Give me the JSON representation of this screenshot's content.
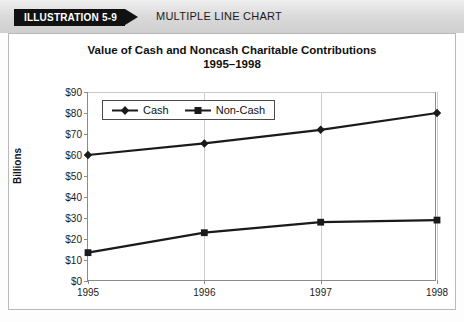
{
  "header": {
    "tag_label": "ILLUSTRATION 5-9",
    "caption": "MULTIPLE LINE CHART"
  },
  "chart_data": {
    "type": "line",
    "title": "Value of Cash and Noncash Charitable Contributions",
    "subtitle": "1995–1998",
    "xlabel": "",
    "ylabel": "Billions",
    "categories": [
      "1995",
      "1996",
      "1997",
      "1998"
    ],
    "ytick_labels": [
      "$0",
      "$10",
      "$20",
      "$30",
      "$40",
      "$50",
      "$60",
      "$70",
      "$80",
      "$90"
    ],
    "ytick_values": [
      0,
      10,
      20,
      30,
      40,
      50,
      60,
      70,
      80,
      90
    ],
    "ylim": [
      0,
      90
    ],
    "grid": "vertical",
    "legend_position": "inside-top-left",
    "series": [
      {
        "name": "Cash",
        "marker": "diamond",
        "color": "#1a1a1a",
        "values": [
          60,
          65.5,
          72,
          80
        ]
      },
      {
        "name": "Non-Cash",
        "marker": "square",
        "color": "#1a1a1a",
        "values": [
          13.5,
          23,
          28,
          29
        ]
      }
    ]
  }
}
